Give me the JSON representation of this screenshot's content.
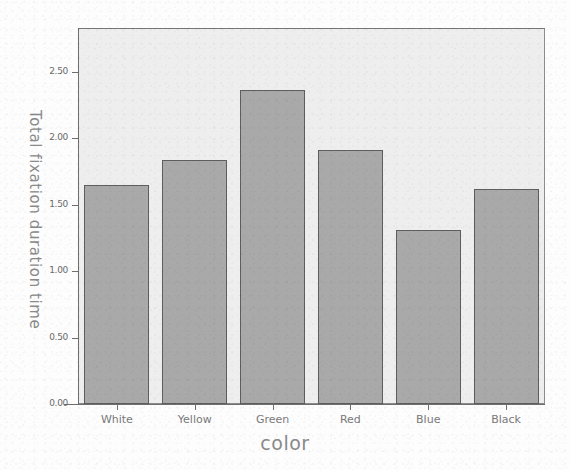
{
  "chart_data": {
    "type": "bar",
    "title": "",
    "categories": [
      "White",
      "Yellow",
      "Green",
      "Red",
      "Blue",
      "Black"
    ],
    "values": [
      1.65,
      1.84,
      2.36,
      1.91,
      1.31,
      1.62
    ],
    "xlabel": "color",
    "ylabel": "Total fixation duration time",
    "ylim": [
      0.0,
      2.83
    ],
    "ytick_labels": [
      "0.00",
      "0.50",
      "1.00",
      "1.50",
      "2.00",
      "2.50"
    ],
    "ytick_values": [
      0.0,
      0.5,
      1.0,
      1.5,
      2.0,
      2.5
    ],
    "grid": false,
    "legend": null,
    "bar_color": "#a9a9a9",
    "bar_border_color": "#5e5e5e",
    "plot_background": "#eeeeee",
    "axis_color": "#6e6e6e",
    "label_color": "#8a8a8a"
  }
}
